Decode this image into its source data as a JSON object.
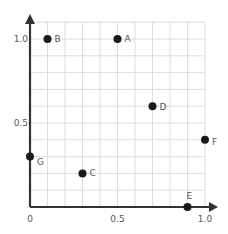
{
  "chart_data": {
    "type": "scatter",
    "title": "",
    "xlabel": "",
    "ylabel": "",
    "xlim": [
      0,
      1.0
    ],
    "ylim": [
      0,
      1.0
    ],
    "grid": true,
    "grid_step": 0.1,
    "legend": null,
    "x_ticks": [
      {
        "value": 0,
        "label": "0"
      },
      {
        "value": 0.5,
        "label": "0.5"
      },
      {
        "value": 1.0,
        "label": "1.0"
      }
    ],
    "y_ticks": [
      {
        "value": 0.5,
        "label": "0.5"
      },
      {
        "value": 1.0,
        "label": "1.0"
      }
    ],
    "points": [
      {
        "label": "A",
        "x": 0.5,
        "y": 1.0
      },
      {
        "label": "B",
        "x": 0.1,
        "y": 1.0
      },
      {
        "label": "C",
        "x": 0.3,
        "y": 0.2
      },
      {
        "label": "D",
        "x": 0.7,
        "y": 0.6
      },
      {
        "label": "E",
        "x": 0.9,
        "y": 0.0
      },
      {
        "label": "F",
        "x": 1.0,
        "y": 0.4
      },
      {
        "label": "G",
        "x": 0.0,
        "y": 0.3
      }
    ]
  },
  "colors": {
    "axis": "#333333",
    "grid": "#dddddd",
    "point": "#1a1a1a",
    "text": "#555555"
  }
}
